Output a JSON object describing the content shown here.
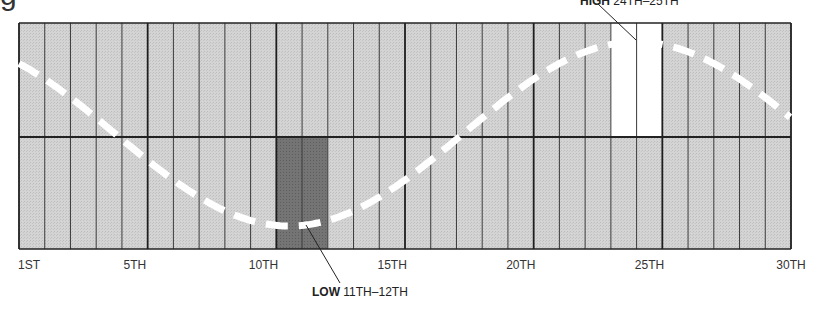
{
  "title_fragment": "g",
  "chart_data": {
    "type": "area",
    "title": "",
    "xlabel": "",
    "ylabel": "",
    "x_range": [
      1,
      30
    ],
    "tick_labels": [
      "1ST",
      "5TH",
      "10TH",
      "15TH",
      "20TH",
      "25TH",
      "30TH"
    ],
    "tick_positions": [
      1,
      5,
      10,
      15,
      20,
      25,
      30
    ],
    "columns": 30,
    "grid": true,
    "midline": true,
    "series": [
      {
        "name": "cycle",
        "style": "dashed-white-curve",
        "shape": "sinusoid",
        "low_day_range": [
          11,
          12
        ],
        "high_day_range": [
          24,
          25
        ]
      }
    ],
    "highlighted_columns": [
      {
        "days": [
          11,
          12
        ],
        "fill": "#6e6e6e",
        "label": "LOW"
      },
      {
        "days": [
          24,
          25
        ],
        "fill": "#ffffff",
        "label": "HIGH"
      }
    ],
    "annotations": [
      {
        "bold": "HIGH",
        "text": " 24TH–25TH"
      },
      {
        "bold": "LOW",
        "text": " 11TH–12TH"
      }
    ]
  },
  "ticks": [
    {
      "label": "1ST",
      "day": 1
    },
    {
      "label": "5TH",
      "day": 5
    },
    {
      "label": "10TH",
      "day": 10
    },
    {
      "label": "15TH",
      "day": 15
    },
    {
      "label": "20TH",
      "day": 20
    },
    {
      "label": "25TH",
      "day": 25
    },
    {
      "label": "30TH",
      "day": 30
    }
  ],
  "callouts": {
    "high": {
      "bold": "HIGH",
      "text": " 24TH–25TH"
    },
    "low": {
      "bold": "LOW",
      "text": " 11TH–12TH"
    }
  },
  "colors": {
    "cell_fill": "#cfcfcf",
    "low_fill": "#6e6e6e",
    "high_fill": "#ffffff",
    "grid_line": "#2a2a2a",
    "curve": "#ffffff"
  }
}
